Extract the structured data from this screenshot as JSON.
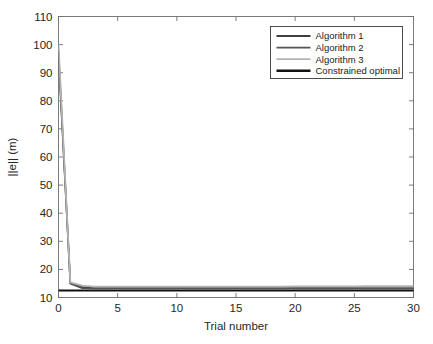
{
  "figure": {
    "background": "#ffffff",
    "axes_color": "#6e6e6e",
    "text_color": "#262626"
  },
  "chart_data": {
    "type": "line",
    "title": "",
    "xlabel": "Trial number",
    "ylabel": "||e|| (m)",
    "xlim": [
      0,
      30
    ],
    "ylim": [
      10,
      110
    ],
    "xticks": [
      0,
      5,
      10,
      15,
      20,
      25,
      30
    ],
    "yticks": [
      10,
      20,
      30,
      40,
      50,
      60,
      70,
      80,
      90,
      100,
      110
    ],
    "xtick_labels": [
      "0",
      "5",
      "10",
      "15",
      "20",
      "25",
      "30"
    ],
    "ytick_labels": [
      "10",
      "20",
      "30",
      "40",
      "50",
      "60",
      "70",
      "80",
      "90",
      "100",
      "110"
    ],
    "grid": false,
    "box": true,
    "tick_direction": "in",
    "legend_position": "top-right",
    "x": [
      0,
      1,
      2,
      3,
      4,
      5,
      6,
      7,
      8,
      9,
      10,
      11,
      12,
      13,
      14,
      15,
      16,
      17,
      18,
      19,
      20,
      21,
      22,
      23,
      24,
      25,
      26,
      27,
      28,
      29,
      30
    ],
    "series": [
      {
        "name": "Algorithm 1",
        "color": "#3f3f3f",
        "width": 1.6,
        "values": [
          97.5,
          15.2,
          13.7,
          13.4,
          13.4,
          13.4,
          13.4,
          13.4,
          13.4,
          13.4,
          13.4,
          13.4,
          13.4,
          13.4,
          13.4,
          13.4,
          13.4,
          13.4,
          13.4,
          13.4,
          13.4,
          13.4,
          13.4,
          13.4,
          13.4,
          13.4,
          13.4,
          13.4,
          13.4,
          13.4,
          13.4
        ]
      },
      {
        "name": "Algorithm 2",
        "color": "#555555",
        "width": 1.6,
        "values": [
          96.0,
          14.9,
          13.3,
          13.2,
          13.2,
          13.2,
          13.2,
          13.2,
          13.2,
          13.2,
          13.2,
          13.2,
          13.2,
          13.2,
          13.2,
          13.2,
          13.2,
          13.2,
          13.2,
          13.2,
          13.2,
          13.2,
          13.2,
          13.2,
          13.2,
          13.2,
          13.2,
          13.2,
          13.2,
          13.2,
          13.2
        ]
      },
      {
        "name": "Algorithm 3",
        "color": "#b3b3b3",
        "width": 1.8,
        "values": [
          100.0,
          15.4,
          14.2,
          13.9,
          13.85,
          13.85,
          13.85,
          13.85,
          13.85,
          13.85,
          13.9,
          13.9,
          13.9,
          13.9,
          13.9,
          13.9,
          13.9,
          13.9,
          13.9,
          13.9,
          13.95,
          13.95,
          13.95,
          13.95,
          13.95,
          13.95,
          14.0,
          14.0,
          14.0,
          14.0,
          14.0
        ]
      },
      {
        "name": "Constrained optimal",
        "color": "#111111",
        "width": 2.2,
        "values": [
          12.5,
          12.5,
          12.5,
          12.5,
          12.5,
          12.5,
          12.5,
          12.5,
          12.5,
          12.5,
          12.5,
          12.5,
          12.5,
          12.5,
          12.5,
          12.5,
          12.5,
          12.5,
          12.5,
          12.5,
          12.5,
          12.5,
          12.5,
          12.5,
          12.5,
          12.5,
          12.5,
          12.5,
          12.5,
          12.5,
          12.5
        ]
      }
    ],
    "legend": [
      {
        "label": "Algorithm 1",
        "color": "#3f3f3f",
        "width": 1.8
      },
      {
        "label": "Algorithm 2",
        "color": "#555555",
        "width": 1.8
      },
      {
        "label": "Algorithm 3",
        "color": "#b3b3b3",
        "width": 1.8
      },
      {
        "label": "Constrained optimal",
        "color": "#111111",
        "width": 2.4
      }
    ]
  }
}
